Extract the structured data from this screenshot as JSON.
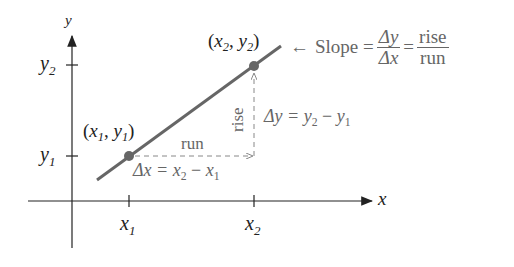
{
  "diagram": {
    "axes": {
      "x_label": "x",
      "y_label": "y"
    },
    "ticks": {
      "x1": "x",
      "x1_sub": "1",
      "x2": "x",
      "x2_sub": "2",
      "y1": "y",
      "y1_sub": "1",
      "y2": "y",
      "y2_sub": "2"
    },
    "points": {
      "p1": {
        "open": "(",
        "x": "x",
        "x_sub": "1",
        "sep": ", ",
        "y": "y",
        "y_sub": "1",
        "close": ")"
      },
      "p2": {
        "open": "(",
        "x": "x",
        "x_sub": "2",
        "sep": ", ",
        "y": "y",
        "y_sub": "2",
        "close": ")"
      }
    },
    "annotations": {
      "run": "run",
      "rise": "rise",
      "delta_x": {
        "lhs": "Δx = ",
        "x2": "x",
        "x2_sub": "2",
        "minus": " − ",
        "x1": "x",
        "x1_sub": "1"
      },
      "delta_y": {
        "lhs": "Δy = ",
        "y2": "y",
        "y2_sub": "2",
        "minus": " − ",
        "y1": "y",
        "y1_sub": "1"
      },
      "slope": {
        "arrow": "←",
        "label": "Slope =",
        "frac1_num": "Δy",
        "frac1_den": "Δx",
        "equals": "=",
        "frac2_num": "rise",
        "frac2_den": "run"
      }
    },
    "colors": {
      "line": "#666666",
      "point": "#666666",
      "axis": "#222222",
      "dashed": "#888888"
    }
  }
}
